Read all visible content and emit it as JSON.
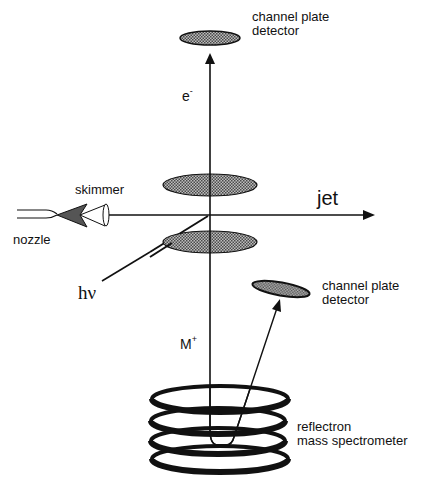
{
  "diagram": {
    "labels": {
      "top_detector_line1": "channel plate",
      "top_detector_line2": "detector",
      "electron": "e",
      "electron_charge": "-",
      "skimmer": "skimmer",
      "nozzle": "nozzle",
      "jet": "jet",
      "photon": "hν",
      "ion": "M",
      "ion_charge": "+",
      "side_detector_line1": "channel plate",
      "side_detector_line2": "detector",
      "reflectron_line1": "reflectron",
      "reflectron_line2": "mass spectrometer"
    },
    "colors": {
      "ink": "#111111",
      "plate_fill": "#8a8a8a",
      "background": "#ffffff"
    },
    "components": [
      {
        "name": "channel-plate-detector-top",
        "shape": "ellipse"
      },
      {
        "name": "extraction-plate-upper",
        "shape": "ellipse"
      },
      {
        "name": "extraction-plate-lower",
        "shape": "ellipse"
      },
      {
        "name": "channel-plate-detector-side",
        "shape": "tilted ellipse"
      },
      {
        "name": "nozzle",
        "shape": "double line"
      },
      {
        "name": "skimmer",
        "shape": "cone"
      },
      {
        "name": "reflectron-rings",
        "count": 4
      }
    ]
  }
}
